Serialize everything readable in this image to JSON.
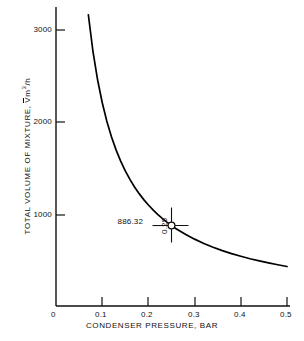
{
  "chart_data": {
    "type": "line",
    "title": "",
    "xlabel": "CONDENSER PRESSURE, BAR",
    "ylabel_prefix": "TOTAL VOLUME OF MIXTURE,",
    "ylabel_symbol": "V",
    "ylabel_units_m": "m",
    "ylabel_units_exp": "3",
    "ylabel_units_per": "/h",
    "xlim": [
      0,
      0.52
    ],
    "ylim": [
      0,
      3300
    ],
    "xticks": [
      0,
      0.1,
      0.2,
      0.3,
      0.4,
      0.5
    ],
    "xtick_labels": [
      "0",
      "0.1",
      "0.2",
      "0.3",
      "0.4",
      "0.5"
    ],
    "yticks": [
      1000,
      2000,
      3000
    ],
    "ytick_labels": [
      "1000",
      "2000",
      "3000"
    ],
    "grid": false,
    "legend": "none",
    "series": [
      {
        "name": "Total volume of mixture vs condenser pressure",
        "relation": "V = 221.58 / P",
        "x": [
          0.0465,
          0.05,
          0.055,
          0.06,
          0.07,
          0.08,
          0.09,
          0.1,
          0.11,
          0.12,
          0.13,
          0.14,
          0.15,
          0.16,
          0.17,
          0.18,
          0.19,
          0.2,
          0.21,
          0.22,
          0.23,
          0.24,
          0.25,
          0.26,
          0.28,
          0.3,
          0.32,
          0.34,
          0.36,
          0.38,
          0.4,
          0.42,
          0.44,
          0.46,
          0.48,
          0.5
        ],
        "y": [
          4765,
          4432,
          4029,
          3693,
          3165,
          2770,
          2462,
          2216,
          2014,
          1846,
          1704,
          1583,
          1477,
          1385,
          1303,
          1231,
          1166,
          1108,
          1055,
          1007,
          963,
          923,
          886,
          852,
          791,
          739,
          692,
          652,
          615,
          583,
          554,
          527,
          504,
          482,
          462,
          443
        ]
      }
    ],
    "annotation": {
      "point_x": 0.25,
      "point_y": 886.32,
      "value_label": "886.32",
      "x_label": "0.25",
      "marker": "circle-with-crosshair"
    },
    "colors": {
      "axis": "#111111",
      "curve": "#000000",
      "text": "#111111",
      "background": "#ffffff"
    }
  },
  "xtick_positions_px": [
    56,
    102,
    148,
    195,
    241,
    287
  ],
  "ytick_positions_px": [
    215,
    122,
    30
  ]
}
